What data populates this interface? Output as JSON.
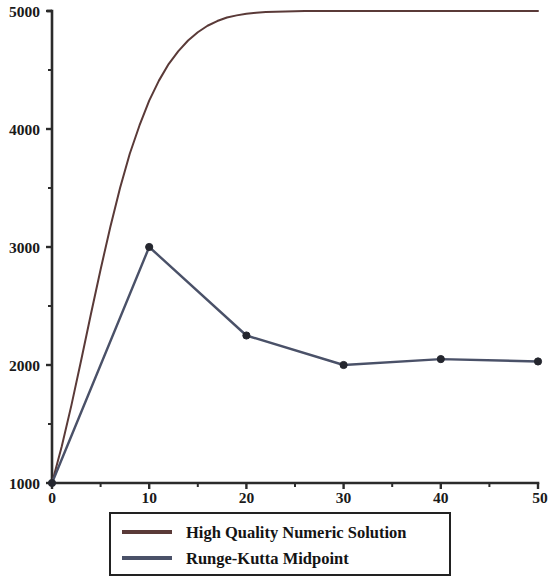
{
  "chart_data": {
    "type": "line",
    "title": "",
    "xlabel": "",
    "ylabel": "",
    "xlim": [
      0,
      50
    ],
    "ylim": [
      1000,
      5000
    ],
    "grid": false,
    "legend_position": "bottom",
    "x_major_ticks": [
      0,
      10,
      20,
      30,
      40,
      50
    ],
    "x_minor_ticks": [
      5,
      15,
      25,
      35,
      45
    ],
    "x_tick_labels": [
      "0",
      "10",
      "20",
      "30",
      "40",
      "50"
    ],
    "y_major_ticks": [
      1000,
      2000,
      3000,
      4000,
      5000
    ],
    "y_minor_ticks": [
      1500,
      2500,
      3500,
      4500
    ],
    "y_tick_labels": [
      "1000",
      "2000",
      "3000",
      "4000",
      "5000"
    ],
    "series": [
      {
        "name": "High Quality Numeric Solution",
        "color": "#5a3a38",
        "marker": "none",
        "line_width": 2.0,
        "x": [
          0,
          1,
          2,
          3,
          4,
          5,
          6,
          7,
          8,
          9,
          10,
          11,
          12,
          13,
          14,
          15,
          16,
          17,
          18,
          19,
          20,
          21,
          22,
          23,
          24,
          25,
          26,
          27,
          28,
          30,
          35,
          40,
          45,
          50
        ],
        "y": [
          1000,
          1310,
          1660,
          2040,
          2430,
          2810,
          3170,
          3500,
          3790,
          4030,
          4240,
          4410,
          4550,
          4660,
          4750,
          4820,
          4875,
          4915,
          4945,
          4963,
          4977,
          4985,
          4991,
          4994,
          4996,
          4998,
          4999,
          5000,
          5000,
          5000,
          5000,
          5000,
          5000,
          5000
        ]
      },
      {
        "name": "Runge-Kutta Midpoint",
        "color": "#4a5168",
        "marker": "circle",
        "line_width": 2.4,
        "x": [
          0,
          10,
          20,
          30,
          40,
          50
        ],
        "y": [
          1000,
          3000,
          2250,
          2000,
          2050,
          2030
        ]
      }
    ]
  },
  "legend": {
    "entries": [
      {
        "label": "High Quality Numeric Solution",
        "color": "#5a3a38"
      },
      {
        "label": "Runge-Kutta Midpoint",
        "color": "#4a5168"
      }
    ],
    "border_color": "#222222"
  },
  "axes": {
    "axis_color": "#2b2b2b"
  }
}
